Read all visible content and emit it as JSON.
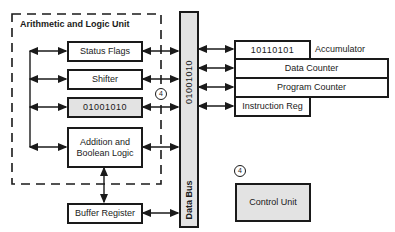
{
  "diagram": {
    "type": "microprocessor-block-diagram",
    "alu": {
      "title": "Arithmetic and Logic Unit",
      "blocks": [
        {
          "id": "status_flags",
          "label": "Status Flags"
        },
        {
          "id": "shifter",
          "label": "Shifter"
        },
        {
          "id": "register",
          "label": "01001010"
        },
        {
          "id": "addition_logic",
          "label": "Addition and Boolean Logic"
        }
      ]
    },
    "buffer_register": {
      "label": "Buffer Register"
    },
    "data_bus": {
      "label": "Data Bus",
      "value": "01001010"
    },
    "registers": [
      {
        "id": "accumulator",
        "value": "10110101",
        "label": "Accumulator"
      },
      {
        "id": "data_counter",
        "label": "Data Counter"
      },
      {
        "id": "program_counter",
        "label": "Program Counter"
      },
      {
        "id": "instruction_reg",
        "label": "Instruction Reg"
      }
    ],
    "control_unit": {
      "label": "Control Unit"
    },
    "step_markers": [
      "4",
      "4"
    ],
    "colors": {
      "line": "#1a1a1a",
      "shaded": "#e3e3e3",
      "background": "#ffffff"
    }
  }
}
